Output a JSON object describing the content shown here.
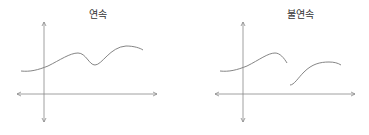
{
  "panels": [
    {
      "title": "연속",
      "description": "continuous function graph"
    },
    {
      "title": "불연속",
      "description": "discontinuous function graph"
    }
  ],
  "colors": {
    "axis": "#888888",
    "curve": "#777777",
    "text": "#333333"
  }
}
